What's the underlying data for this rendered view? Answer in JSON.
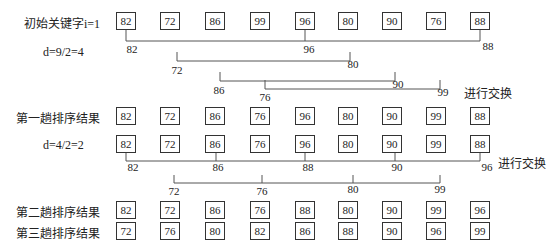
{
  "labels": {
    "initial": "初始关键字i=1",
    "d1": "d=9/2=4",
    "pass1": "第一趟排序结果",
    "d2": "d=4/2=2",
    "pass2": "第二趟排序结果",
    "pass3": "第三趟排序结果",
    "swap1": "进行交换",
    "swap2": "进行交换"
  },
  "rows": {
    "initial": [
      "82",
      "72",
      "86",
      "99",
      "96",
      "80",
      "90",
      "76",
      "88"
    ],
    "pass1": [
      "82",
      "72",
      "86",
      "76",
      "96",
      "80",
      "90",
      "99",
      "88"
    ],
    "d2row": [
      "82",
      "72",
      "86",
      "76",
      "96",
      "80",
      "90",
      "99",
      "88"
    ],
    "pass2": [
      "82",
      "72",
      "86",
      "76",
      "88",
      "80",
      "90",
      "99",
      "96"
    ],
    "pass3": [
      "72",
      "76",
      "80",
      "82",
      "86",
      "88",
      "90",
      "96",
      "99"
    ]
  },
  "groups1": {
    "g0": [
      "82",
      "96",
      "88"
    ],
    "g1": [
      "72",
      "80"
    ],
    "g2": [
      "86",
      "90"
    ],
    "g3": [
      "76",
      "99"
    ]
  },
  "groups2": {
    "g0": [
      "82",
      "86",
      "88",
      "90",
      "96"
    ],
    "g1": [
      "72",
      "76",
      "80",
      "99"
    ]
  }
}
